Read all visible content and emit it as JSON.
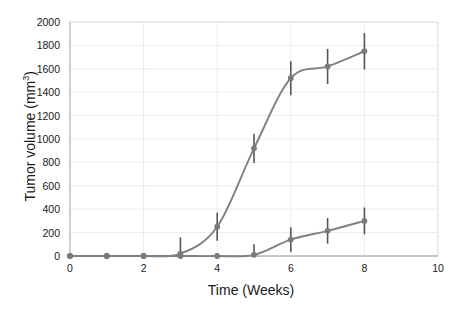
{
  "chart_data": {
    "type": "line",
    "title": "",
    "xlabel": "Time (Weeks)",
    "ylabel": "Tumor volume (mm3)",
    "ylabel_html": "Tumor volume (mm<sup>3</sup>)",
    "xlim": [
      0,
      10
    ],
    "ylim": [
      0,
      2000
    ],
    "xticks": [
      0,
      2,
      4,
      6,
      8,
      10
    ],
    "xtick_labels": [
      "0",
      "2",
      "4",
      "6",
      "8",
      "10"
    ],
    "yticks": [
      0,
      200,
      400,
      600,
      800,
      1000,
      1200,
      1400,
      1600,
      1800,
      2000
    ],
    "ytick_labels": [
      "0",
      "200",
      "400",
      "600",
      "800",
      "1000",
      "1200",
      "1400",
      "1600",
      "1800",
      "2000"
    ],
    "grid": true,
    "grid_axis": "y",
    "legend": "none",
    "colors": {
      "line": "#808080",
      "marker": "#7a7a7a",
      "errorbar": "#555555",
      "grid": "#ececec",
      "axis": "#b5b5b5",
      "text": "#1a1a1a",
      "background": "#ffffff"
    },
    "series": [
      {
        "name": "Untreated control",
        "x": [
          0,
          1,
          2,
          3,
          4,
          5,
          6,
          7,
          8
        ],
        "values": [
          0,
          0,
          0,
          20,
          250,
          920,
          1520,
          1620,
          1750
        ],
        "errors": [
          0,
          0,
          0,
          140,
          120,
          125,
          145,
          150,
          155
        ]
      },
      {
        "name": "Treated",
        "x": [
          0,
          1,
          2,
          3,
          4,
          5,
          6,
          7,
          8
        ],
        "values": [
          0,
          0,
          0,
          0,
          0,
          10,
          140,
          215,
          300
        ],
        "errors": [
          0,
          0,
          0,
          0,
          0,
          90,
          105,
          110,
          115
        ]
      }
    ]
  }
}
